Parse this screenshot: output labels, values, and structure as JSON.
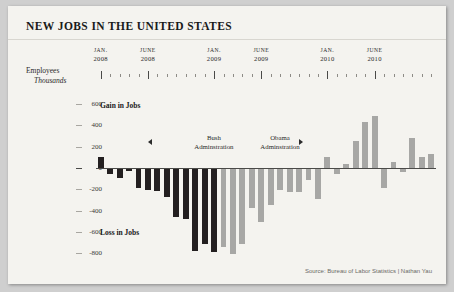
{
  "title": "NEW JOBS IN THE UNITED STATES",
  "axis": {
    "y_unit_line1": "Employees",
    "y_unit_line2": "Thousands",
    "y_ticks": [
      600,
      400,
      200,
      0,
      -200,
      -400,
      -600,
      -800
    ],
    "y_tick_labels": [
      "600",
      "400",
      "200",
      "0",
      "-200",
      "-400",
      "-600",
      "-800"
    ],
    "x_labels": [
      {
        "month": "JAN.",
        "year": "2008",
        "index": 0
      },
      {
        "month": "JUNE",
        "year": "2008",
        "index": 5
      },
      {
        "month": "JAN.",
        "year": "2009",
        "index": 12
      },
      {
        "month": "JUNE",
        "year": "2009",
        "index": 17
      },
      {
        "month": "JAN.",
        "year": "2010",
        "index": 24
      },
      {
        "month": "JUNE",
        "year": "2010",
        "index": 29
      }
    ]
  },
  "annotations": {
    "gain": "Gain in Jobs",
    "loss": "Loss in Jobs",
    "bush_line1": "Bush",
    "bush_line2": "Adminstration",
    "obama_line1": "Obama",
    "obama_line2": "Adminstration",
    "arrow_left": "left-arrow",
    "arrow_right": "right-arrow"
  },
  "source": "Source: Bureau of Labor Statistics | Nathan Yau",
  "colors": {
    "bush": "#231f20",
    "obama": "#a7a7a5",
    "card": "#f4f3ef",
    "page": "#cfcfcf",
    "axis": "#4a4a48"
  },
  "chart_data": {
    "type": "bar",
    "title": "NEW JOBS IN THE UNITED STATES",
    "xlabel": "",
    "ylabel": "Employees Thousands",
    "ylim": [
      -850,
      650
    ],
    "grid": false,
    "legend": "none",
    "categories": [
      "Jan 2008",
      "Feb 2008",
      "Mar 2008",
      "Apr 2008",
      "May 2008",
      "Jun 2008",
      "Jul 2008",
      "Aug 2008",
      "Sep 2008",
      "Oct 2008",
      "Nov 2008",
      "Dec 2008",
      "Jan 2009",
      "Feb 2009",
      "Mar 2009",
      "Apr 2009",
      "May 2009",
      "Jun 2009",
      "Jul 2009",
      "Aug 2009",
      "Sep 2009",
      "Oct 2009",
      "Nov 2009",
      "Dec 2009",
      "Jan 2010",
      "Feb 2010",
      "Mar 2010",
      "Apr 2010",
      "May 2010",
      "Jun 2010",
      "Jul 2010",
      "Aug 2010",
      "Sep 2010",
      "Oct 2010",
      "Nov 2010",
      "Dec 2010"
    ],
    "values": [
      100,
      -50,
      -80,
      -20,
      -180,
      -200,
      -210,
      -260,
      -450,
      -470,
      -770,
      -700,
      -780,
      -730,
      -800,
      -700,
      -370,
      -500,
      -340,
      -200,
      -220,
      -220,
      -100,
      -280,
      100,
      -50,
      40,
      250,
      430,
      490,
      -180,
      60,
      -30,
      280,
      100,
      130
    ],
    "series_groups": [
      {
        "name": "Bush Adminstration",
        "color": "#231f20",
        "start_index": 0,
        "end_index": 12
      },
      {
        "name": "Obama Adminstration",
        "color": "#a7a7a5",
        "start_index": 13,
        "end_index": 35
      }
    ]
  }
}
